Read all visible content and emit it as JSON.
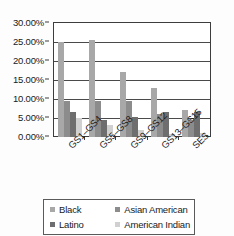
{
  "chart_data": {
    "type": "bar",
    "title": "",
    "xlabel": "",
    "ylabel": "",
    "categories": [
      "GS1–GS4",
      "GS5–GS8",
      "GS9–GS12",
      "GS13–GS15",
      "SES"
    ],
    "series": [
      {
        "name": "Black",
        "color": "#a8a8a8",
        "values": [
          25.0,
          25.5,
          17.0,
          13.0,
          7.0
        ]
      },
      {
        "name": "Asian American",
        "color": "#8c8c8c",
        "values": [
          9.4,
          9.4,
          9.4,
          6.0,
          4.4
        ]
      },
      {
        "name": "Latino",
        "color": "#6e6e6e",
        "values": [
          6.5,
          4.5,
          5.3,
          6.6,
          6.6
        ]
      },
      {
        "name": "American Indian",
        "color": "#d0d0d0",
        "values": [
          5.0,
          3.1,
          1.8,
          0.8,
          1.1
        ]
      }
    ],
    "ylim": [
      0,
      30
    ],
    "ytick_values": [
      30,
      25,
      20,
      15,
      10,
      5,
      0
    ],
    "ytick_labels": [
      "30.00%",
      "25.00%",
      "20.00%",
      "15.00%",
      "10.00%",
      "5.00%",
      "0.00%"
    ],
    "grid": true,
    "legend_position": "bottom",
    "axis_color": "#3d3d3d",
    "plot_background": "#ffffff"
  }
}
